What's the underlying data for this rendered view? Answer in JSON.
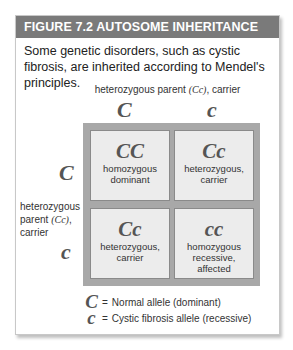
{
  "figure": {
    "title": "FIGURE 7.2  AUTOSOME INHERITANCE",
    "intro": "Some genetic disorders, such as cystic fibrosis, are inherited according to Mendel's principles."
  },
  "top_parent": {
    "label_pre": "heterozygous parent ",
    "genotype": "(Cc)",
    "label_post": ", carrier",
    "alleles": [
      "C",
      "c"
    ]
  },
  "left_parent": {
    "label_pre": "heterozygous parent ",
    "genotype": "(Cc)",
    "label_post": ", carrier",
    "alleles": [
      "C",
      "c"
    ]
  },
  "punnett": {
    "cells": [
      {
        "genotype": "CC",
        "line1": "homozygous",
        "line2": "dominant"
      },
      {
        "genotype": "Cc",
        "line1": "heterozygous,",
        "line2": "carrier"
      },
      {
        "genotype": "Cc",
        "line1": "heterozygous,",
        "line2": "carrier"
      },
      {
        "genotype": "cc",
        "line1": "homozygous",
        "line2": "recessive, affected"
      }
    ]
  },
  "legend": [
    {
      "symbol": "C",
      "eq": "=",
      "text": "Normal allele (dominant)"
    },
    {
      "symbol": "c",
      "eq": "=",
      "text": "Cystic fibrosis allele (recessive)"
    }
  ],
  "colors": {
    "header_bg": "#7a7a7a",
    "grid_border": "#a8a8a8",
    "cell_bg": "#ececec",
    "allele_text": "#555555"
  }
}
